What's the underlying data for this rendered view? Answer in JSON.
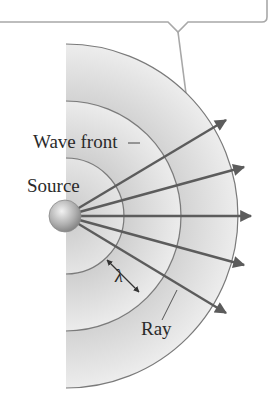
{
  "diagram": {
    "labels": {
      "wave_front": "Wave front",
      "source": "Source",
      "wavelength": "λ",
      "ray": "Ray"
    },
    "colors": {
      "background": "#ffffff",
      "wave_fill_light": "#efefef",
      "wave_fill_dark": "#d4d4d4",
      "arc_stroke": "#7a7a7a",
      "ray": "#5c5c5c",
      "callout_border": "#a8a8a8",
      "source_sphere": "#b5b5b5",
      "text": "#2a2a2a"
    },
    "source_center": [
      66,
      216
    ],
    "wavefront_radii": [
      58,
      115,
      172
    ],
    "rays_count": 5,
    "icons": [
      "source-sphere-icon",
      "arrow-icon",
      "double-arrow-icon"
    ]
  }
}
